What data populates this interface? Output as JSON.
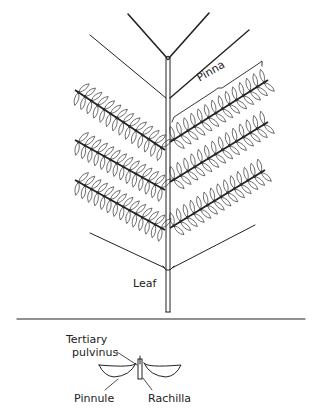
{
  "diagram": {
    "type": "botanical-illustration",
    "labels": {
      "pinna": "Pinna",
      "leaf": "Leaf",
      "tertiary_pulvinus_line1": "Tertiary",
      "tertiary_pulvinus_line2": "pulvinus",
      "pinnule": "Pinnule",
      "rachilla": "Rachilla"
    },
    "colors": {
      "line": "#222222",
      "background": "#ffffff"
    },
    "pinnae": {
      "left": [
        {
          "x1": 75,
          "y1": 90,
          "x2": 165,
          "y2": 150
        },
        {
          "x1": 75,
          "y1": 140,
          "x2": 165,
          "y2": 190
        },
        {
          "x1": 75,
          "y1": 180,
          "x2": 165,
          "y2": 230
        }
      ],
      "right": [
        {
          "x1": 170,
          "y1": 142,
          "x2": 268,
          "y2": 80
        },
        {
          "x1": 170,
          "y1": 182,
          "x2": 268,
          "y2": 122
        },
        {
          "x1": 170,
          "y1": 228,
          "x2": 265,
          "y2": 170
        }
      ]
    }
  }
}
